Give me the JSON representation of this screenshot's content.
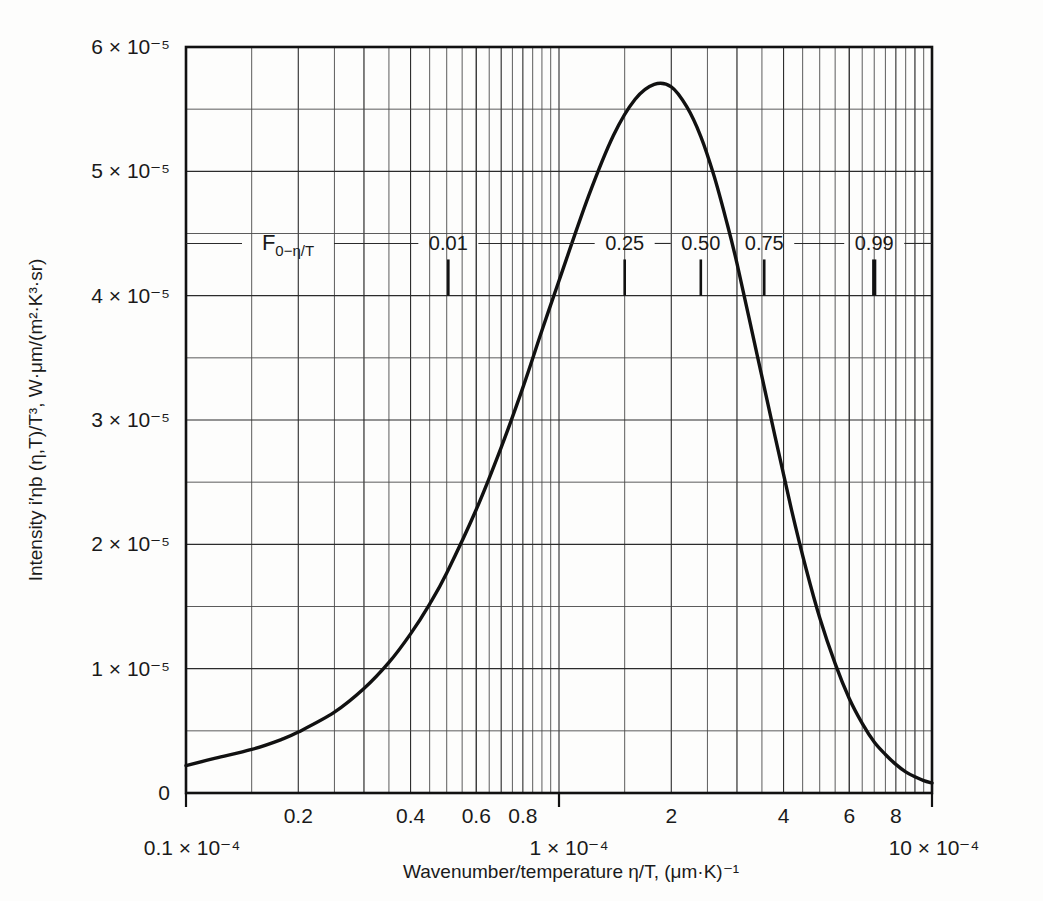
{
  "chart_data": {
    "type": "line",
    "title": "",
    "xlabel": "Wavenumber/temperature η/T, (μm·K)⁻¹",
    "ylabel": "Intensity i′ηb (η,T)/T³, W·μm/(m²·K³·sr)",
    "xscale": "log",
    "yscale": "linear",
    "xlim": [
      1e-05,
      0.001
    ],
    "ylim": [
      0,
      6e-05
    ],
    "grid": true,
    "legend": "none",
    "x_tick_labels": [
      "0.1 × 10⁻⁴",
      "0.2",
      "0.4",
      "0.6",
      "0.8",
      "1 × 10⁻⁴",
      "2",
      "4",
      "6",
      "8",
      "10 × 10⁻⁴"
    ],
    "x_tick_values": [
      1e-05,
      2e-05,
      4e-05,
      6e-05,
      8e-05,
      0.0001,
      0.0002,
      0.0004,
      0.0006,
      0.0008,
      0.001
    ],
    "y_tick_labels": [
      "0",
      "1 × 10⁻⁵",
      "2 × 10⁻⁵",
      "3 × 10⁻⁵",
      "4 × 10⁻⁵",
      "5 × 10⁻⁵",
      "6 × 10⁻⁵"
    ],
    "y_tick_values": [
      0,
      1e-05,
      2e-05,
      3e-05,
      4e-05,
      5e-05,
      6e-05
    ],
    "y_minor_values": [
      5e-06,
      1.5e-05,
      2.5e-05,
      3.5e-05,
      4.5e-05,
      5.5e-05
    ],
    "series": [
      {
        "name": "Planck blackbody spectral intensity (wavenumber form)",
        "x": [
          1e-05,
          1.2e-05,
          1.5e-05,
          1.8e-05,
          2e-05,
          2.5e-05,
          3e-05,
          3.5e-05,
          4e-05,
          4.5e-05,
          5e-05,
          6e-05,
          7e-05,
          8e-05,
          9e-05,
          0.0001,
          0.00012,
          0.00014,
          0.00016,
          0.00018,
          0.0002,
          0.00022,
          0.00024,
          0.00026,
          0.00028,
          0.0003,
          0.00034,
          0.00038,
          0.00042,
          0.00046,
          0.0005,
          0.00055,
          0.0006,
          0.00065,
          0.0007,
          0.00075,
          0.0008,
          0.00085,
          0.0009,
          0.00095,
          0.001
        ],
        "y": [
          2.2e-06,
          2.8e-06,
          3.5e-06,
          4.3e-06,
          4.9e-06,
          6.5e-06,
          8.4e-06,
          1.05e-05,
          1.28e-05,
          1.52e-05,
          1.77e-05,
          2.28e-05,
          2.78e-05,
          3.26e-05,
          3.72e-05,
          4.12e-05,
          4.8e-05,
          5.29e-05,
          5.58e-05,
          5.7e-05,
          5.68e-05,
          5.52e-05,
          5.28e-05,
          4.97e-05,
          4.62e-05,
          4.26e-05,
          3.52e-05,
          2.86e-05,
          2.28e-05,
          1.8e-05,
          1.41e-05,
          1.04e-05,
          7.6e-06,
          5.6e-06,
          4.1e-06,
          3.1e-06,
          2.3e-06,
          1.7e-06,
          1.3e-06,
          1e-06,
          8e-07
        ]
      }
    ],
    "peak": {
      "x": 0.000195,
      "y": 5.7e-05
    },
    "annotations": {
      "name": "F₀₋η/T",
      "name_plain": "F",
      "name_sub": "0−η/T",
      "items": [
        {
          "label": "0.01",
          "x": 5.05e-05,
          "bold": false
        },
        {
          "label": "0.25",
          "x": 0.00015,
          "bold": false
        },
        {
          "label": "0.50",
          "x": 0.00024,
          "bold": false
        },
        {
          "label": "0.75",
          "x": 0.000355,
          "bold": false
        },
        {
          "label": "0.99",
          "x": 0.0007,
          "bold": true
        }
      ]
    },
    "colors": {
      "curve": "#111111",
      "grid_major": "#2b2b2b",
      "grid_minor": "#4a4a4a",
      "frame": "#111111",
      "background": "#fdfdfc",
      "text": "#1a1a1a"
    }
  },
  "y_axis": {
    "labels": [
      {
        "text": "6 × 10⁻⁵",
        "value": 6e-05
      },
      {
        "text": "5 × 10⁻⁵",
        "value": 5e-05
      },
      {
        "text": "4 × 10⁻⁵",
        "value": 4e-05
      },
      {
        "text": "3 × 10⁻⁵",
        "value": 3e-05
      },
      {
        "text": "2 × 10⁻⁵",
        "value": 2e-05
      },
      {
        "text": "1 × 10⁻⁵",
        "value": 1e-05
      },
      {
        "text": "0",
        "value": 0
      }
    ],
    "title": "Intensity i′ηb (η,T)/T³, W·μm/(m²·K³·sr)"
  },
  "x_axis": {
    "title": "Wavenumber/temperature η/T, (μm·K)⁻¹",
    "labels": [
      {
        "text": "0.2",
        "value": 2e-05
      },
      {
        "text": "0.4",
        "value": 4e-05
      },
      {
        "text": "0.6",
        "value": 6e-05
      },
      {
        "text": "0.8",
        "value": 8e-05
      },
      {
        "text": "2",
        "value": 0.0002
      },
      {
        "text": "4",
        "value": 0.0004
      },
      {
        "text": "6",
        "value": 0.0006
      },
      {
        "text": "8",
        "value": 0.0008
      }
    ],
    "start_label": "0.1 × 10⁻⁴",
    "mid_label": "1 × 10⁻⁴",
    "end_label": "10 × 10⁻⁴"
  }
}
